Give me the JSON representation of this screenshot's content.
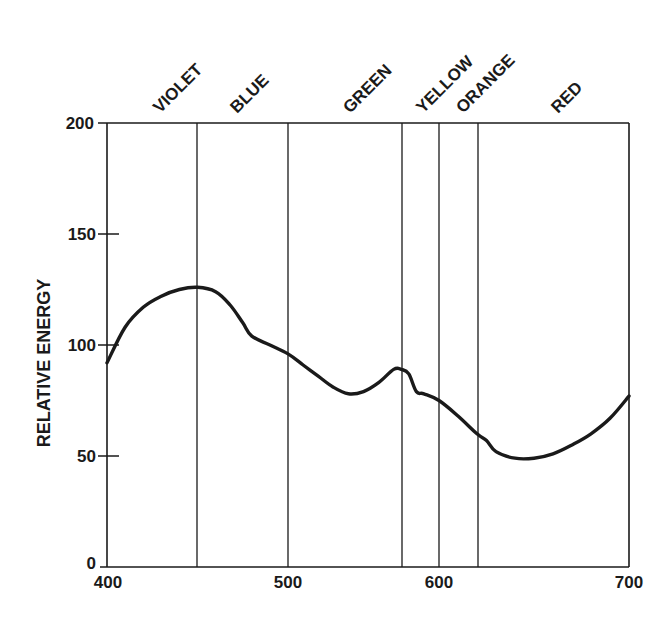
{
  "chart_data": {
    "type": "line",
    "title": "",
    "xlabel": "",
    "ylabel": "RELATIVE ENERGY",
    "xlim": [
      400,
      700
    ],
    "ylim": [
      0,
      200
    ],
    "grid": false,
    "legend": null,
    "x_ticks": [
      400,
      500,
      600,
      700
    ],
    "y_ticks": [
      0,
      50,
      100,
      150,
      200
    ],
    "color_bands": [
      {
        "label": "VIOLET",
        "start": 400,
        "end": 450
      },
      {
        "label": "BLUE",
        "start": 450,
        "end": 500
      },
      {
        "label": "GREEN",
        "start": 500,
        "end": 575
      },
      {
        "label": "YELLOW",
        "start": 575,
        "end": 600
      },
      {
        "label": "ORANGE",
        "start": 600,
        "end": 625
      },
      {
        "label": "RED",
        "start": 625,
        "end": 700
      }
    ],
    "band_boundaries": [
      450,
      500,
      575,
      600,
      625
    ],
    "series": [
      {
        "name": "Relative energy",
        "x": [
          400,
          410,
          420,
          430,
          440,
          450,
          460,
          468,
          475,
          480,
          490,
          500,
          510,
          520,
          530,
          540,
          550,
          560,
          570,
          575,
          580,
          585,
          590,
          600,
          610,
          620,
          625,
          630,
          640,
          650,
          660,
          670,
          680,
          690,
          700
        ],
        "values": [
          92,
          108,
          117,
          122,
          125,
          126,
          124,
          118,
          110,
          104,
          100,
          96,
          91,
          86,
          81,
          78,
          79,
          83,
          89,
          89,
          87,
          79,
          78,
          75,
          68,
          60,
          57,
          52,
          49,
          49,
          51,
          55,
          60,
          67,
          77
        ]
      }
    ]
  },
  "axis": {
    "y_title": "RELATIVE ENERGY",
    "y_tick_labels": [
      "0",
      "50",
      "100",
      "150",
      "200"
    ],
    "x_tick_labels": [
      "400",
      "500",
      "600",
      "700"
    ]
  },
  "bands": {
    "violet": "VIOLET",
    "blue": "BLUE",
    "green": "GREEN",
    "yellow": "YELLOW",
    "orange": "ORANGE",
    "red": "RED"
  },
  "colors": {
    "ink": "#1a1a1a",
    "background": "#ffffff"
  }
}
